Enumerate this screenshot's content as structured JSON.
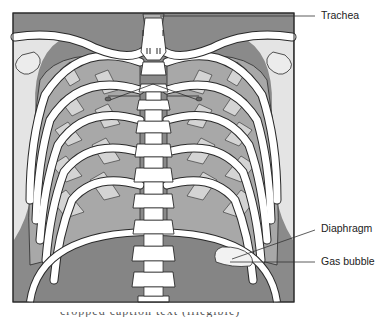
{
  "figure": {
    "labels": [
      {
        "id": "trachea",
        "text": "Trachea"
      },
      {
        "id": "diaphragm",
        "text": "Diaphragm"
      },
      {
        "id": "gas_bubble",
        "text": "Gas bubble"
      }
    ],
    "caption_fragment": "cropped caption text (illegible)"
  },
  "colors": {
    "background": "#ffffff",
    "frame_dark": "#808080",
    "soft_tissue_light": "#e6e6e6",
    "lung_mid": "#a6a6a6",
    "lung_light": "#cfcfcf",
    "bone": "#ffffff",
    "outline": "#2a2a2a",
    "abdomen": "#858585"
  }
}
